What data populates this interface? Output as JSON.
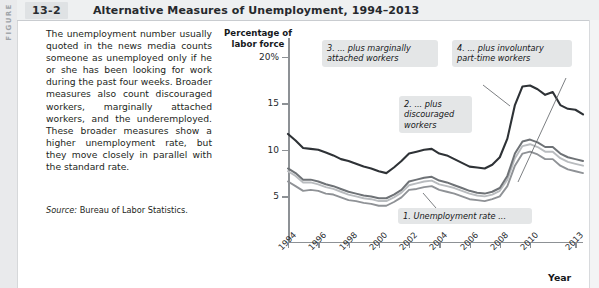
{
  "figure": {
    "spine_label": "FIGURE",
    "number": "13-2",
    "title": "Alternative Measures of Unemployment, 1994–2013"
  },
  "body": {
    "paragraph": "The unemployment number usually quoted in the news media counts someone as unemployed only if he or she has been looking for work during the past four weeks. Broader measures also count discouraged workers, marginally attached workers, and the underemployed. These broader measures show a higher unemployment rate, but they move closely in parallel with the standard rate.",
    "source_prefix": "Source:",
    "source_text": " Bureau of Labor Statistics."
  },
  "chart_data": {
    "type": "line",
    "title": "Alternative Measures of Unemployment, 1994–2013",
    "ylabel": "Percentage of\nlabor force",
    "ylabel_line1": "Percentage of",
    "ylabel_line2": "labor force",
    "xlabel": "Year",
    "ylim": [
      0,
      22
    ],
    "xlim": [
      1994,
      2013.5
    ],
    "grid": false,
    "legend": "annotations",
    "yticks": [
      {
        "value": 20,
        "label": "20%"
      },
      {
        "value": 15,
        "label": "15"
      },
      {
        "value": 10,
        "label": "10"
      },
      {
        "value": 5,
        "label": "5"
      }
    ],
    "xticks": [
      {
        "value": 1994,
        "label": "1994"
      },
      {
        "value": 1996,
        "label": "1996"
      },
      {
        "value": 1998,
        "label": "1998"
      },
      {
        "value": 2000,
        "label": "2000"
      },
      {
        "value": 2002,
        "label": "2002"
      },
      {
        "value": 2004,
        "label": "2004"
      },
      {
        "value": 2006,
        "label": "2006"
      },
      {
        "value": 2008,
        "label": "2008"
      },
      {
        "value": 2010,
        "label": "2010"
      },
      {
        "value": 2013,
        "label": "2013"
      }
    ],
    "x": [
      1994,
      1994.5,
      1995,
      1995.5,
      1996,
      1996.5,
      1997,
      1997.5,
      1998,
      1998.5,
      1999,
      1999.5,
      2000,
      2000.5,
      2001,
      2001.5,
      2002,
      2002.5,
      2003,
      2003.5,
      2004,
      2004.5,
      2005,
      2005.5,
      2006,
      2006.5,
      2007,
      2007.5,
      2008,
      2008.5,
      2009,
      2009.5,
      2010,
      2010.5,
      2011,
      2011.5,
      2012,
      2012.5,
      2013,
      2013.5
    ],
    "series": [
      {
        "name": "1. Unemployment rate",
        "color": "#8f9296",
        "width": 1.9,
        "values": [
          6.6,
          6.1,
          5.6,
          5.7,
          5.6,
          5.3,
          5.2,
          4.9,
          4.6,
          4.5,
          4.3,
          4.2,
          4.0,
          4.0,
          4.4,
          4.9,
          5.7,
          5.8,
          6.0,
          6.1,
          5.7,
          5.5,
          5.3,
          5.0,
          4.7,
          4.6,
          4.5,
          4.7,
          5.0,
          6.1,
          8.3,
          9.6,
          9.8,
          9.5,
          9.0,
          9.0,
          8.3,
          7.9,
          7.7,
          7.5
        ]
      },
      {
        "name": "2. ... plus discouraged workers",
        "color": "#b9bcbf",
        "width": 1.9,
        "values": [
          7.7,
          7.2,
          6.5,
          6.5,
          6.3,
          6.0,
          5.8,
          5.5,
          5.2,
          5.0,
          4.8,
          4.7,
          4.5,
          4.5,
          4.9,
          5.4,
          6.2,
          6.4,
          6.6,
          6.7,
          6.3,
          6.1,
          5.9,
          5.6,
          5.3,
          5.1,
          5.0,
          5.2,
          5.6,
          6.8,
          9.1,
          10.4,
          10.6,
          10.3,
          9.8,
          9.8,
          9.1,
          8.7,
          8.5,
          8.3
        ]
      },
      {
        "name": "3. ... plus marginally attached workers",
        "color": "#6e7276",
        "width": 2.0,
        "values": [
          8.0,
          7.5,
          6.8,
          6.8,
          6.6,
          6.3,
          6.1,
          5.8,
          5.5,
          5.3,
          5.1,
          5.0,
          4.8,
          4.8,
          5.2,
          5.7,
          6.6,
          6.8,
          7.0,
          7.1,
          6.7,
          6.5,
          6.2,
          5.9,
          5.6,
          5.4,
          5.3,
          5.5,
          5.9,
          7.2,
          9.6,
          10.9,
          11.1,
          10.8,
          10.3,
          10.3,
          9.6,
          9.2,
          9.0,
          8.8
        ]
      },
      {
        "name": "4. ... plus involuntary part-time workers",
        "color": "#2e3236",
        "width": 2.1,
        "values": [
          11.7,
          11.0,
          10.2,
          10.1,
          10.0,
          9.7,
          9.4,
          9.0,
          8.8,
          8.5,
          8.2,
          8.0,
          7.7,
          7.5,
          8.1,
          8.8,
          9.6,
          9.8,
          10.0,
          10.1,
          9.6,
          9.4,
          9.0,
          8.6,
          8.2,
          8.1,
          8.0,
          8.4,
          9.2,
          11.2,
          14.8,
          16.8,
          16.9,
          16.5,
          15.9,
          16.2,
          14.8,
          14.4,
          14.3,
          13.8
        ]
      }
    ],
    "annotations": [
      {
        "id": "annot-3",
        "text": "3. ... plus marginally\nattached workers"
      },
      {
        "id": "annot-4",
        "text": "4. ... plus involuntary\npart-time workers"
      },
      {
        "id": "annot-2",
        "text": "2. ... plus\ndiscouraged\nworkers"
      },
      {
        "id": "annot-1",
        "text": "1. Unemployment rate ..."
      }
    ]
  }
}
